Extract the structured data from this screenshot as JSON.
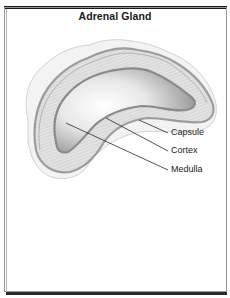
{
  "title": "Adrenal Gland",
  "labels": [
    {
      "id": "capsule",
      "text": "Capsule"
    },
    {
      "id": "cortex",
      "text": "Cortex"
    },
    {
      "id": "medulla",
      "text": "Medulla"
    }
  ],
  "colors": {
    "frame_dark": "#1a1a1a",
    "frame_gray": "#9a9a9a",
    "fat_fill": "#f4f4f4",
    "capsule_stroke": "#9c9c9c",
    "cortex_fill": "#dedede",
    "medulla_fill": "#eeeeee",
    "medulla_shadow": "#8e8e8e"
  }
}
